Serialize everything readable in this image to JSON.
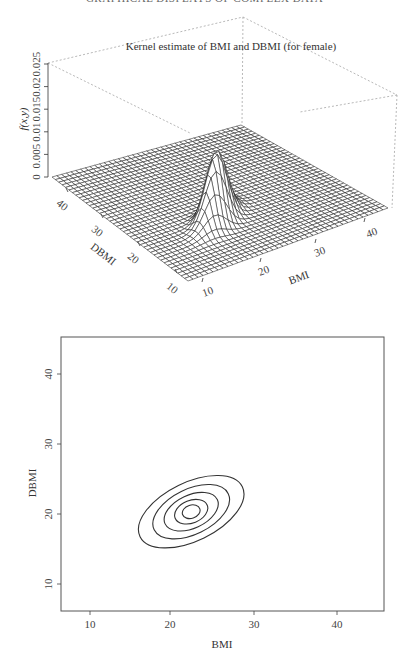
{
  "page": {
    "running_header": "GRAPHICAL DISPLAYS OF COMPLEX DATA"
  },
  "chart_data": [
    {
      "type": "surface",
      "title": "Kernel estimate of BMI and DBMI (for female)",
      "xlabel": "BMI",
      "ylabel": "DBMI",
      "zlabel": "f(x,y)",
      "x_ticks": [
        "10",
        "20",
        "30",
        "40"
      ],
      "y_ticks": [
        "10",
        "20",
        "30",
        "40"
      ],
      "z_ticks": [
        "0",
        "0.005",
        "0.01",
        "0.015",
        "0.02",
        "0.025"
      ],
      "xlim": [
        8,
        45
      ],
      "ylim": [
        8,
        45
      ],
      "zlim": [
        0,
        0.025
      ],
      "peak": {
        "x": 22,
        "y": 20.5,
        "z": 0.0155
      },
      "kernel": {
        "sx": 2.6,
        "sy": 2.0,
        "rho": 0.6
      },
      "grid_size": 40,
      "mesh_color": "#222222"
    },
    {
      "type": "contour",
      "xlabel": "BMI",
      "ylabel": "DBMI",
      "x_ticks": [
        "10",
        "20",
        "30",
        "40"
      ],
      "y_ticks": [
        "10",
        "20",
        "30",
        "40"
      ],
      "xlim": [
        6.5,
        45.7
      ],
      "ylim": [
        6.1,
        45.3
      ],
      "center": {
        "x": 22.3,
        "y": 20.3
      },
      "levels": [
        {
          "level": 1,
          "rx": 6.9,
          "ry": 2.2,
          "angle_deg": -26
        },
        {
          "level": 2,
          "rx": 5.0,
          "ry": 1.7,
          "angle_deg": -26
        },
        {
          "level": 3,
          "rx": 3.5,
          "ry": 1.25,
          "angle_deg": -25
        },
        {
          "level": 4,
          "rx": 2.1,
          "ry": 0.85,
          "angle_deg": -22
        },
        {
          "level": 5,
          "rx": 1.1,
          "ry": 0.5,
          "angle_deg": -18
        }
      ],
      "line_color": "#333333",
      "grid": false
    }
  ]
}
